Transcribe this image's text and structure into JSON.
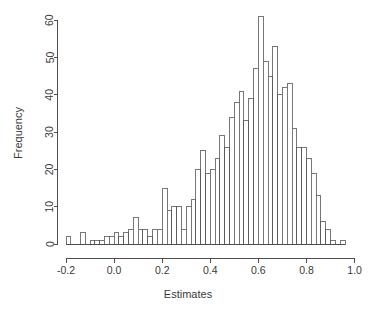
{
  "chart_data": {
    "type": "bar",
    "subtype": "histogram",
    "title": "",
    "xlabel": "Estimates",
    "ylabel": "Frequency",
    "xlim": [
      -0.2,
      1.0
    ],
    "ylim": [
      0,
      60
    ],
    "xticks": [
      -0.2,
      0.0,
      0.2,
      0.4,
      0.6,
      0.8,
      1.0
    ],
    "xtick_labels": [
      "-0.2",
      "0.0",
      "0.2",
      "0.4",
      "0.6",
      "0.8",
      "1.0"
    ],
    "yticks": [
      0,
      10,
      20,
      30,
      40,
      50,
      60
    ],
    "ytick_labels": [
      "0",
      "10",
      "20",
      "30",
      "40",
      "50",
      "60"
    ],
    "grid": false,
    "legend": false,
    "bin_width": 0.02,
    "bin_start": -0.2,
    "bin_edges": [
      -0.2,
      -0.18,
      -0.16,
      -0.14,
      -0.12,
      -0.1,
      -0.08,
      -0.06,
      -0.04,
      -0.02,
      0.0,
      0.02,
      0.04,
      0.06,
      0.08,
      0.1,
      0.12,
      0.14,
      0.16,
      0.18,
      0.2,
      0.22,
      0.24,
      0.26,
      0.28,
      0.3,
      0.32,
      0.34,
      0.36,
      0.38,
      0.4,
      0.42,
      0.44,
      0.46,
      0.48,
      0.5,
      0.52,
      0.54,
      0.56,
      0.58,
      0.6,
      0.62,
      0.64,
      0.66,
      0.68,
      0.7,
      0.72,
      0.74,
      0.76,
      0.78,
      0.8,
      0.82,
      0.84,
      0.86,
      0.88,
      0.9,
      0.92,
      0.94,
      0.96
    ],
    "categories": [
      "-0.19",
      "-0.17",
      "-0.15",
      "-0.13",
      "-0.11",
      "-0.09",
      "-0.07",
      "-0.05",
      "-0.03",
      "-0.01",
      "0.01",
      "0.03",
      "0.05",
      "0.07",
      "0.09",
      "0.11",
      "0.13",
      "0.15",
      "0.17",
      "0.19",
      "0.21",
      "0.23",
      "0.25",
      "0.27",
      "0.29",
      "0.31",
      "0.33",
      "0.35",
      "0.37",
      "0.39",
      "0.41",
      "0.43",
      "0.45",
      "0.47",
      "0.49",
      "0.51",
      "0.53",
      "0.55",
      "0.57",
      "0.59",
      "0.61",
      "0.63",
      "0.65",
      "0.67",
      "0.69",
      "0.71",
      "0.73",
      "0.75",
      "0.77",
      "0.79",
      "0.81",
      "0.83",
      "0.85",
      "0.87",
      "0.89",
      "0.91",
      "0.93",
      "0.95"
    ],
    "values": [
      2,
      0,
      0,
      3,
      0,
      1,
      1,
      1,
      2,
      2,
      3,
      2,
      3,
      4,
      7,
      4,
      4,
      2,
      4,
      4,
      15,
      9,
      10,
      10,
      4,
      10,
      12,
      20,
      25,
      19,
      20,
      23,
      29,
      26,
      34,
      38,
      41,
      33,
      39,
      47,
      61,
      49,
      45,
      53,
      40,
      42,
      43,
      31,
      26,
      26,
      23,
      19,
      13,
      6,
      4,
      1,
      0,
      1
    ],
    "ylabel_rotation": -90,
    "bar_fill": "#ffffff",
    "bar_stroke": "#555555",
    "axis_color": "#4d4d4d",
    "background": "#ffffff"
  },
  "plot": {
    "x_axis_title": "Estimates",
    "y_axis_title": "Frequency"
  }
}
